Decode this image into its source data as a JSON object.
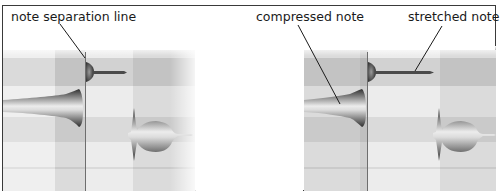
{
  "figure": {
    "type": "before-after comparison of note timing edit",
    "panels": [
      {
        "id": "before",
        "annotations": [
          {
            "text": "note separation line",
            "target": "separation-line"
          }
        ]
      },
      {
        "id": "after",
        "annotations": [
          {
            "text": "compressed note",
            "target": "compressed-note"
          },
          {
            "text": "stretched note",
            "target": "stretched-note"
          }
        ]
      }
    ]
  },
  "labels": {
    "note_separation_line": "note separation line",
    "compressed_note": "compressed note",
    "stretched_note": "stretched note"
  },
  "colors": {
    "frame_border": "#3a3a3a",
    "grid_dark": "#c4c4c4",
    "grid_mid": "#d6d6d6",
    "grid_light": "#ebebeb",
    "separator_line": "#6e6e6e",
    "leader_line": "#1a1a1a",
    "note_dark": "#3c3c3c",
    "note_light": "#e6e6e6"
  }
}
